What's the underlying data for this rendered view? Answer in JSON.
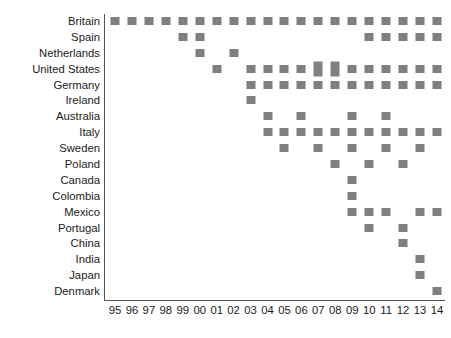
{
  "chart_data": {
    "type": "scatter",
    "title": "",
    "subtitle": "",
    "xlabel": "",
    "ylabel": "",
    "grid": false,
    "legend": false,
    "marker_color": "#808080",
    "axis_color": "#555555",
    "background": "#ffffff",
    "x_tick_labels": [
      "95",
      "96",
      "97",
      "98",
      "99",
      "00",
      "01",
      "02",
      "03",
      "04",
      "05",
      "06",
      "07",
      "08",
      "09",
      "10",
      "11",
      "12",
      "13",
      "14"
    ],
    "x_values": [
      1995,
      1996,
      1997,
      1998,
      1999,
      2000,
      2001,
      2002,
      2003,
      2004,
      2005,
      2006,
      2007,
      2008,
      2009,
      2010,
      2011,
      2012,
      2013,
      2014
    ],
    "xlim": [
      1994.5,
      2014.5
    ],
    "categories": [
      "Britain",
      "Spain",
      "Netherlands",
      "United States",
      "Germany",
      "Ireland",
      "Australia",
      "Italy",
      "Sweden",
      "Poland",
      "Canada",
      "Colombia",
      "Mexico",
      "Portugal",
      "China",
      "India",
      "Japan",
      "Denmark"
    ],
    "series": [
      {
        "name": "Britain",
        "years": [
          "95",
          "96",
          "97",
          "98",
          "99",
          "00",
          "01",
          "02",
          "03",
          "04",
          "05",
          "06",
          "07",
          "08",
          "09",
          "10",
          "11",
          "12",
          "13",
          "14"
        ]
      },
      {
        "name": "Spain",
        "years": [
          "99",
          "00",
          "10",
          "11",
          "12",
          "13",
          "14"
        ]
      },
      {
        "name": "Netherlands",
        "years": [
          "00",
          "02"
        ]
      },
      {
        "name": "United States",
        "years": [
          "01",
          "03",
          "04",
          "05",
          "06",
          "07",
          "08",
          "09",
          "10",
          "11",
          "12",
          "13",
          "14"
        ]
      },
      {
        "name": "Germany",
        "years": [
          "03",
          "04",
          "05",
          "06",
          "07",
          "08",
          "09",
          "10",
          "11",
          "12",
          "13",
          "14"
        ]
      },
      {
        "name": "Ireland",
        "years": [
          "03"
        ]
      },
      {
        "name": "Australia",
        "years": [
          "04",
          "06",
          "09",
          "11"
        ]
      },
      {
        "name": "Italy",
        "years": [
          "04",
          "05",
          "06",
          "07",
          "08",
          "09",
          "10",
          "11",
          "12",
          "13",
          "14"
        ]
      },
      {
        "name": "Sweden",
        "years": [
          "05",
          "07",
          "09",
          "11",
          "13"
        ]
      },
      {
        "name": "Poland",
        "years": [
          "08",
          "10",
          "12"
        ]
      },
      {
        "name": "Canada",
        "years": [
          "09"
        ]
      },
      {
        "name": "Colombia",
        "years": [
          "09"
        ]
      },
      {
        "name": "Mexico",
        "years": [
          "09",
          "10",
          "11",
          "13",
          "14"
        ]
      },
      {
        "name": "Portugal",
        "years": [
          "10",
          "12"
        ]
      },
      {
        "name": "China",
        "years": [
          "12"
        ]
      },
      {
        "name": "India",
        "years": [
          "13"
        ]
      },
      {
        "name": "Japan",
        "years": [
          "13"
        ]
      },
      {
        "name": "Denmark",
        "years": [
          "14"
        ]
      }
    ],
    "tall_markers": [
      {
        "name": "United States",
        "year": "07"
      },
      {
        "name": "United States",
        "year": "08"
      }
    ]
  }
}
